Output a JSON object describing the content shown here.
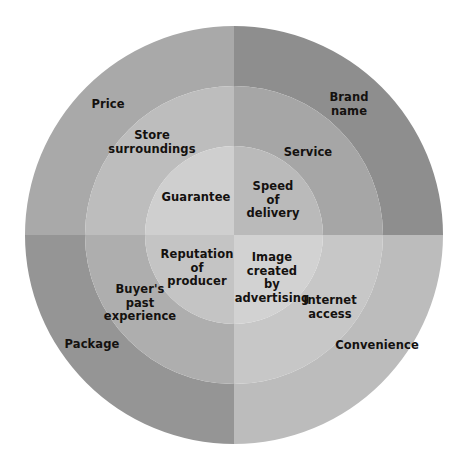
{
  "diagram": {
    "background_color": "#ffffff",
    "text_color": "#14110f",
    "center": {
      "x": 234,
      "y": 235
    },
    "radii": {
      "inner": 89,
      "middle": 149,
      "outer": 209
    },
    "quadrants": [
      {
        "name": "top-left",
        "colors": {
          "outer": "#a9a9a9",
          "middle": "#bdbdbd",
          "inner": "#cfcfcf"
        },
        "labels": [
          {
            "key": "price",
            "text": "Price",
            "ring": "outer",
            "x": 108,
            "y": 105
          },
          {
            "key": "store-surroundings",
            "text": "Store\nsurroundings",
            "ring": "middle",
            "x": 152,
            "y": 142
          },
          {
            "key": "guarantee",
            "text": "Guarantee",
            "ring": "inner",
            "x": 196,
            "y": 198
          }
        ]
      },
      {
        "name": "top-right",
        "colors": {
          "outer": "#8e8e8e",
          "middle": "#a6a6a6",
          "inner": "#bababa"
        },
        "labels": [
          {
            "key": "brand-name",
            "text": "Brand\nname",
            "ring": "outer",
            "x": 349,
            "y": 104
          },
          {
            "key": "service",
            "text": "Service",
            "ring": "middle",
            "x": 308,
            "y": 153
          },
          {
            "key": "speed-of-delivery",
            "text": "Speed\nof\ndelivery",
            "ring": "inner",
            "x": 273,
            "y": 200
          }
        ]
      },
      {
        "name": "bottom-left",
        "colors": {
          "outer": "#959595",
          "middle": "#aeaeae",
          "inner": "#c4c4c4"
        },
        "labels": [
          {
            "key": "package",
            "text": "Package",
            "ring": "outer",
            "x": 92,
            "y": 345
          },
          {
            "key": "buyers-past-experience",
            "text": "Buyer's\npast\nexperience",
            "ring": "middle",
            "x": 140,
            "y": 303
          },
          {
            "key": "reputation-of-producer",
            "text": "Reputation\nof\nproducer",
            "ring": "inner",
            "x": 197,
            "y": 268
          }
        ]
      },
      {
        "name": "bottom-right",
        "colors": {
          "outer": "#bcbcbc",
          "middle": "#c7c7c7",
          "inner": "#d2d2d2"
        },
        "labels": [
          {
            "key": "convenience",
            "text": "Convenience",
            "ring": "outer",
            "x": 377,
            "y": 346
          },
          {
            "key": "internet-access",
            "text": "Internet\naccess",
            "ring": "middle",
            "x": 330,
            "y": 307
          },
          {
            "key": "image-created-by-advertising",
            "text": "Image\ncreated\nby\nadvertising",
            "ring": "inner",
            "x": 272,
            "y": 278
          }
        ]
      }
    ]
  }
}
